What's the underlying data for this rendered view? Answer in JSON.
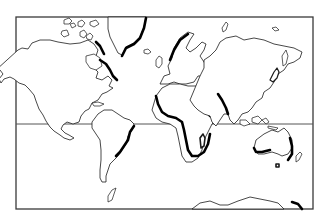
{
  "map": {
    "type": "world-map",
    "projection": "mercator-style",
    "style": "black-and-white outline",
    "frame": {
      "left": 16,
      "top": 17,
      "right": 313,
      "bottom": 209
    },
    "equator_y": 124,
    "colors": {
      "background": "#ffffff",
      "outline": "#1a1a1a",
      "emphasis": "#000000",
      "frame": "#3a3a3a"
    },
    "landmasses": [
      "North America",
      "Greenland",
      "South America",
      "Europe",
      "Africa",
      "Asia",
      "Australia",
      "New Zealand",
      "Antarctica",
      "Madagascar",
      "Japan",
      "British Isles"
    ],
    "emphasized_coasts": [
      "Greenland east coast",
      "Labrador / Baffin coast",
      "Scandinavia west coast",
      "Brazil east coast",
      "Africa west and south coast",
      "Red Sea / East Africa",
      "India west coast",
      "Australia southwest and east coast",
      "Antarctica east edge"
    ]
  }
}
